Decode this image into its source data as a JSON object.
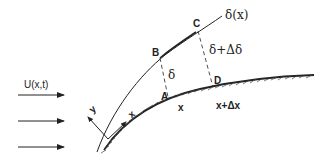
{
  "diagram": {
    "flow_label": "U(x,t)",
    "boundary_layer_label": "δ(x)",
    "points": {
      "A": "A",
      "B": "B",
      "C": "C",
      "D": "D"
    },
    "thickness_label": "δ",
    "thickness_plus_label": "δ+Δδ",
    "x_position_label": "x",
    "x_plus_label": "x+Δx",
    "axis_x_label": "x",
    "axis_y_label": "y",
    "colors": {
      "line": "#222222",
      "background": "#ffffff"
    }
  }
}
